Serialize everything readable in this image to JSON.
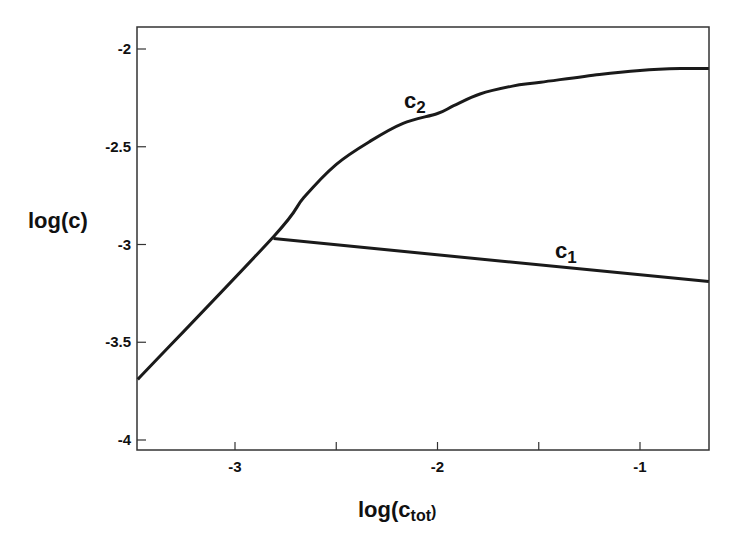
{
  "chart_data": {
    "type": "line",
    "title": "",
    "xlabel": "log(c_tot)",
    "xlabel_main": "log(c",
    "xlabel_sub": "tot",
    "xlabel_close": ")",
    "ylabel": "log(c)",
    "xlim": [
      -3.48,
      -0.66
    ],
    "ylim": [
      -4.05,
      -1.89
    ],
    "grid": false,
    "legend": "inline labels",
    "x_ticks": [
      -3,
      -2,
      -1
    ],
    "x_tick_labels": [
      "-3",
      "-2",
      "-1"
    ],
    "x_minor_ticks": [
      -2.5,
      -1.5
    ],
    "y_ticks": [
      -2,
      -2.5,
      -3,
      -3.5,
      -4
    ],
    "y_tick_labels": [
      "-2",
      "-2.5",
      "-3",
      "-3.5",
      "-4"
    ],
    "series": [
      {
        "name": "c2",
        "label_main": "c",
        "label_sub": "2",
        "x": [
          -3.48,
          -2.81,
          -2.66,
          -2.5,
          -2.33,
          -2.17,
          -2.0,
          -1.92,
          -1.79,
          -1.63,
          -1.49,
          -1.2,
          -1.0,
          -0.8,
          -0.66
        ],
        "y": [
          -3.69,
          -2.96,
          -2.76,
          -2.59,
          -2.47,
          -2.38,
          -2.33,
          -2.29,
          -2.23,
          -2.19,
          -2.17,
          -2.13,
          -2.11,
          -2.1,
          -2.1
        ],
        "label_pos": [
          -2.15,
          -2.25
        ]
      },
      {
        "name": "c1",
        "label_main": "c",
        "label_sub": "1",
        "x": [
          -2.81,
          -0.66
        ],
        "y": [
          -2.97,
          -3.19
        ],
        "label_pos": [
          -1.6,
          -3.07
        ]
      }
    ]
  },
  "colors": {
    "line": "#1a1a1a",
    "frame": "#333333"
  }
}
